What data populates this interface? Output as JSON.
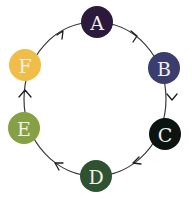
{
  "diagram": {
    "type": "cycle",
    "direction": "clockwise",
    "nodes": [
      {
        "id": "A",
        "label": "A",
        "color": "#2b1a3c"
      },
      {
        "id": "B",
        "label": "B",
        "color": "#3a3d6e"
      },
      {
        "id": "C",
        "label": "C",
        "color": "#0c1412"
      },
      {
        "id": "D",
        "label": "D",
        "color": "#2f5330"
      },
      {
        "id": "E",
        "label": "E",
        "color": "#86a046"
      },
      {
        "id": "F",
        "label": "F",
        "color": "#f0bd48"
      }
    ],
    "edges": [
      {
        "from": "A",
        "to": "B"
      },
      {
        "from": "B",
        "to": "C"
      },
      {
        "from": "C",
        "to": "D"
      },
      {
        "from": "D",
        "to": "E"
      },
      {
        "from": "E",
        "to": "F"
      },
      {
        "from": "F",
        "to": "A"
      }
    ],
    "edge_color": "#3a3a3a",
    "label_color": "#f2f0ea"
  }
}
